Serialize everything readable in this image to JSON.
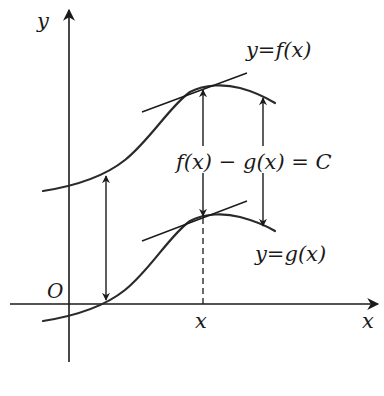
{
  "figure": {
    "axes": {
      "x_label": "x",
      "y_label": "y",
      "origin_label": "O",
      "x_tick_label": "x"
    },
    "curves": [
      {
        "name": "f",
        "label": "y=f(x)"
      },
      {
        "name": "g",
        "label": "y=g(x)"
      }
    ],
    "equation_label": "f(x) − g(x) = C",
    "colors": {
      "ink": "#1a1a1a",
      "background": "#ffffff"
    }
  }
}
